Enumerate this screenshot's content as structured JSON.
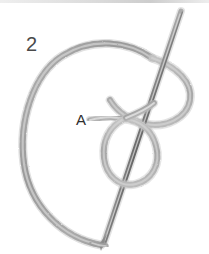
{
  "figure": {
    "kind": "pencil-sketch-illustration",
    "width": 209,
    "height": 254,
    "background_color": "#ffffff",
    "step_number": "2",
    "point_label": "A",
    "thread_color": "#a9a9a9",
    "thread_shade_color": "#8f8f8f",
    "thread_highlight_color": "#e3e3e3",
    "needle_color": "#8a8a8a",
    "needle_shade_color": "#6f6f6f",
    "label_color": "#333333",
    "parts": {
      "step_number_name": "step-number",
      "point_label_name": "point-a",
      "needle_name": "sewing-needle",
      "thread_name": "thread-loop"
    }
  }
}
